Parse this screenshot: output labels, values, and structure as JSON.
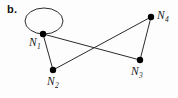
{
  "figure": {
    "panel_label": "b.",
    "background_color": "#fdfdfd",
    "width": 178,
    "height": 98
  },
  "graph": {
    "type": "undirected-node-link-diagram",
    "edge_color": "#2b2b2b",
    "node_color": "#000000",
    "node_radius": 3,
    "edge_width": 1,
    "nodes": [
      {
        "id": "N1",
        "label": "N",
        "subscript": "1",
        "x": 43,
        "y": 34
      },
      {
        "id": "N2",
        "label": "N",
        "subscript": "2",
        "x": 53,
        "y": 70
      },
      {
        "id": "N3",
        "label": "N",
        "subscript": "3",
        "x": 140,
        "y": 60
      },
      {
        "id": "N4",
        "label": "N",
        "subscript": "4",
        "x": 151,
        "y": 17
      }
    ],
    "edges": [
      {
        "from": "N1",
        "to": "N1",
        "kind": "self-loop"
      },
      {
        "from": "N1",
        "to": "N2",
        "kind": "straight"
      },
      {
        "from": "N1",
        "to": "N3",
        "kind": "straight"
      },
      {
        "from": "N2",
        "to": "N4",
        "kind": "straight"
      },
      {
        "from": "N3",
        "to": "N4",
        "kind": "straight"
      }
    ],
    "self_loop": {
      "node": "N1",
      "center_x": 44,
      "center_y": 21,
      "radius_x": 19,
      "radius_y": 13
    }
  }
}
